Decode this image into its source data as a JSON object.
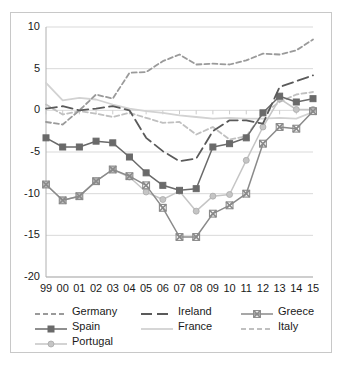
{
  "chart_data": {
    "type": "line",
    "title": "",
    "subtitle": "",
    "xlabel": "",
    "ylabel": "",
    "xlim": [
      0,
      16
    ],
    "ylim": [
      -20,
      10
    ],
    "yticks": [
      10,
      5,
      0,
      -5,
      -10,
      -15,
      -20
    ],
    "grid": "horizontal",
    "legend_position": "bottom",
    "categories": [
      "99",
      "00",
      "01",
      "02",
      "03",
      "04",
      "05",
      "06",
      "07",
      "08",
      "09",
      "10",
      "11",
      "12",
      "13",
      "14",
      "15"
    ],
    "series": [
      {
        "name": "Germany",
        "color": "#9a9a9a",
        "style": "dashed",
        "marker": "none",
        "values": [
          -1.4,
          -1.7,
          0.0,
          1.9,
          1.4,
          4.5,
          4.6,
          5.9,
          6.7,
          5.5,
          5.6,
          5.5,
          6.0,
          6.8,
          6.7,
          7.2,
          8.5
        ]
      },
      {
        "name": "Ireland",
        "color": "#5a5a5a",
        "style": "long-dash",
        "marker": "none",
        "values": [
          0.2,
          0.5,
          0.0,
          0.2,
          0.5,
          0.0,
          -3.3,
          -4.9,
          -6.1,
          -5.8,
          -2.5,
          -1.2,
          -1.2,
          -1.6,
          2.8,
          3.5,
          4.2
        ]
      },
      {
        "name": "Greece",
        "color": "#8a8a8a",
        "style": "solid",
        "marker": "x",
        "values": [
          -8.9,
          -10.8,
          -10.3,
          -8.5,
          -7.1,
          -7.9,
          -9.0,
          -11.7,
          -15.2,
          -15.2,
          -12.4,
          -11.4,
          -10.0,
          -4.0,
          -2.0,
          -2.2,
          -0.1
        ]
      },
      {
        "name": "Spain",
        "color": "#6a6a6a",
        "style": "solid",
        "marker": "square",
        "values": [
          -3.3,
          -4.4,
          -4.4,
          -3.7,
          -3.9,
          -5.6,
          -7.5,
          -9.0,
          -9.6,
          -9.4,
          -4.4,
          -4.0,
          -3.3,
          -0.3,
          1.7,
          1.0,
          1.4
        ]
      },
      {
        "name": "France",
        "color": "#d2d2d2",
        "style": "solid",
        "marker": "none",
        "values": [
          3.3,
          1.2,
          1.5,
          1.3,
          0.7,
          0.2,
          -0.1,
          -0.3,
          -0.6,
          -0.8,
          -1.0,
          -0.9,
          -1.0,
          -1.0,
          -0.9,
          -1.0,
          -0.2
        ]
      },
      {
        "name": "Italy",
        "color": "#c0c0c0",
        "style": "dashed",
        "marker": "none",
        "values": [
          0.7,
          -0.5,
          -0.1,
          -0.4,
          -0.8,
          -0.3,
          -0.9,
          -1.5,
          -1.4,
          -2.9,
          -2.0,
          -3.5,
          -3.1,
          -0.4,
          1.0,
          1.9,
          2.2
        ]
      },
      {
        "name": "Portugal",
        "color": "#c5c5c5",
        "style": "solid",
        "marker": "circle",
        "values": [
          -8.9,
          -10.8,
          -10.3,
          -8.5,
          -7.1,
          -8.0,
          -9.8,
          -10.7,
          -9.7,
          -12.1,
          -10.3,
          -10.1,
          -6.0,
          -2.0,
          1.4,
          0.1,
          0.1
        ]
      }
    ]
  },
  "legend": {
    "rows": [
      [
        {
          "label": "Germany",
          "series": "Germany"
        },
        {
          "label": "Ireland",
          "series": "Ireland"
        },
        {
          "label": "Greece",
          "series": "Greece"
        }
      ],
      [
        {
          "label": "Spain",
          "series": "Spain"
        },
        {
          "label": "France",
          "series": "France"
        },
        {
          "label": "Italy",
          "series": "Italy"
        }
      ],
      [
        {
          "label": "Portugal",
          "series": "Portugal"
        }
      ]
    ]
  }
}
